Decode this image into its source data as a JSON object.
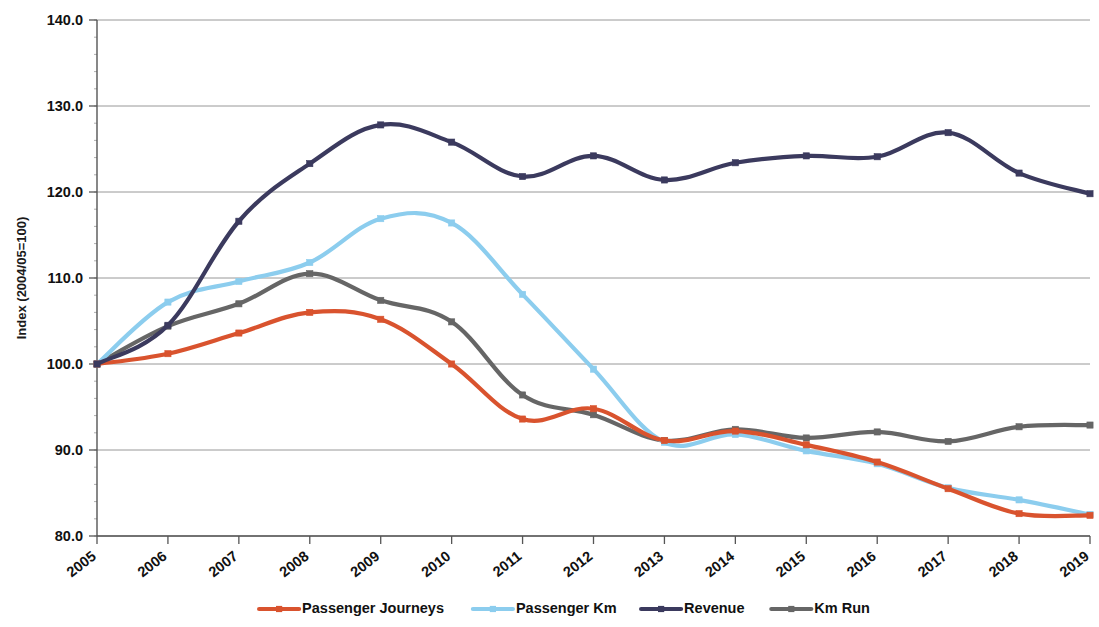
{
  "chart_data": {
    "type": "line",
    "title": "",
    "xlabel": "",
    "ylabel": "Index (2004/05=100)",
    "categories": [
      "2005",
      "2006",
      "2007",
      "2008",
      "2009",
      "2010",
      "2011",
      "2012",
      "2013",
      "2014",
      "2015",
      "2016",
      "2017",
      "2018",
      "2019"
    ],
    "ylim": [
      80.0,
      140.0
    ],
    "ytick_labels": [
      "80.0",
      "90.0",
      "100.0",
      "110.0",
      "120.0",
      "130.0",
      "140.0"
    ],
    "ytick_values": [
      80.0,
      90.0,
      100.0,
      110.0,
      120.0,
      130.0,
      140.0
    ],
    "grid": true,
    "legend_position": "bottom",
    "series": [
      {
        "name": "Passenger Journeys",
        "color": "#d9532e",
        "values": [
          100.0,
          101.2,
          103.6,
          106.0,
          105.2,
          100.0,
          93.6,
          94.8,
          91.1,
          92.2,
          90.6,
          88.6,
          85.5,
          82.6,
          82.4
        ]
      },
      {
        "name": "Passenger Km",
        "color": "#8ccdee",
        "values": [
          100.0,
          107.2,
          109.6,
          111.8,
          116.9,
          116.4,
          108.1,
          99.4,
          90.9,
          91.8,
          89.9,
          88.4,
          85.6,
          84.2,
          82.5
        ]
      },
      {
        "name": "Revenue",
        "color": "#3b3a5e",
        "values": [
          100.0,
          104.5,
          116.6,
          123.3,
          127.8,
          125.8,
          121.8,
          124.2,
          121.4,
          123.4,
          124.2,
          124.1,
          126.9,
          122.2,
          119.8
        ]
      },
      {
        "name": "Km Run",
        "color": "#666666",
        "values": [
          100.0,
          104.4,
          107.0,
          110.5,
          107.4,
          104.9,
          96.4,
          94.1,
          91.1,
          92.4,
          91.4,
          92.1,
          91.0,
          92.7,
          92.9
        ]
      }
    ]
  },
  "legend": {
    "items": [
      {
        "label": "Passenger Journeys",
        "color": "#d9532e"
      },
      {
        "label": "Passenger Km",
        "color": "#8ccdee"
      },
      {
        "label": "Revenue",
        "color": "#3b3a5e"
      },
      {
        "label": "Km Run",
        "color": "#666666"
      }
    ]
  }
}
